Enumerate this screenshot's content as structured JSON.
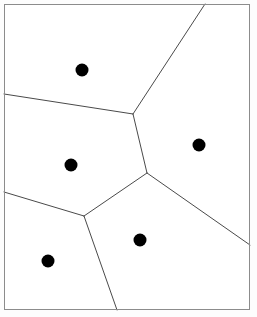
{
  "figure": {
    "title": "",
    "type": "voronoi-diagram",
    "width": 257,
    "height": 317,
    "background_color": "#fdfdfd",
    "plot_background_color": "#ffffff"
  },
  "frame": {
    "x": 4,
    "y": 4,
    "width": 246,
    "height": 306,
    "stroke_color": "#8c8c8c",
    "stroke_width": 1
  },
  "style": {
    "edge_color": "#4a4a4a",
    "edge_width": 1,
    "site_color": "#000000",
    "site_radius": 6.5
  },
  "chart_data": {
    "type": "scatter",
    "title": "",
    "xlabel": "",
    "ylabel": "",
    "xlim": [
      4,
      250
    ],
    "ylim": [
      4,
      310
    ],
    "grid": false,
    "legend": "none",
    "sites": [
      {
        "name": "site-1",
        "x": 82,
        "y": 70
      },
      {
        "name": "site-2",
        "x": 199,
        "y": 145
      },
      {
        "name": "site-3",
        "x": 71,
        "y": 165
      },
      {
        "name": "site-4",
        "x": 140,
        "y": 240
      },
      {
        "name": "site-5",
        "x": 48,
        "y": 261
      }
    ],
    "vertices": [
      {
        "name": "vertex-top",
        "x": 133,
        "y": 114
      },
      {
        "name": "vertex-middle",
        "x": 147,
        "y": 173
      },
      {
        "name": "vertex-lower-left",
        "x": 84,
        "y": 216
      }
    ],
    "edges": [
      {
        "name": "edge-vtop-to-top-border",
        "x1": 133,
        "y1": 114,
        "x2": 205,
        "y2": 4
      },
      {
        "name": "edge-vtop-to-left-border",
        "x1": 133,
        "y1": 114,
        "x2": 4,
        "y2": 94
      },
      {
        "name": "edge-vtop-to-vmiddle",
        "x1": 133,
        "y1": 114,
        "x2": 147,
        "y2": 173
      },
      {
        "name": "edge-vmiddle-to-right-border",
        "x1": 147,
        "y1": 173,
        "x2": 250,
        "y2": 245
      },
      {
        "name": "edge-vmiddle-to-vlowerleft",
        "x1": 147,
        "y1": 173,
        "x2": 84,
        "y2": 216
      },
      {
        "name": "edge-vlowerleft-to-left-border",
        "x1": 84,
        "y1": 216,
        "x2": 4,
        "y2": 192
      },
      {
        "name": "edge-vlowerleft-to-bottom-border",
        "x1": 84,
        "y1": 216,
        "x2": 117,
        "y2": 310
      }
    ]
  }
}
